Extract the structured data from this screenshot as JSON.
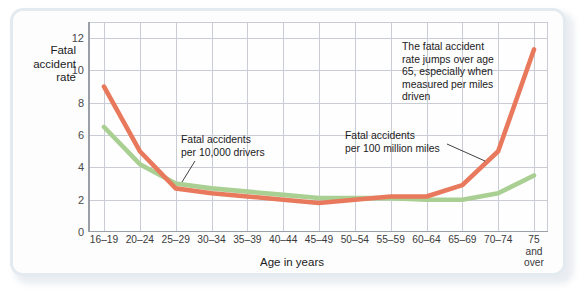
{
  "chart_data": {
    "type": "line",
    "title": "",
    "xlabel": "Age in years",
    "ylabel": "Fatal accident rate",
    "ylim": [
      0,
      13
    ],
    "yticks": [
      0,
      2,
      4,
      6,
      8,
      10,
      12
    ],
    "grid": true,
    "legend_position": "inline-annotations",
    "categories": [
      "16–19",
      "20–24",
      "25–29",
      "30–34",
      "35–39",
      "40–44",
      "45–49",
      "50–54",
      "55–59",
      "60–64",
      "65–69",
      "70–74",
      "75\nand\nover"
    ],
    "series": [
      {
        "name": "Fatal accidents per 100 million miles",
        "color": "#e8795c",
        "values": [
          9.0,
          5.0,
          2.7,
          2.4,
          2.2,
          2.0,
          1.8,
          2.0,
          2.2,
          2.2,
          2.9,
          5.0,
          11.3
        ]
      },
      {
        "name": "Fatal accidents per 10,000 drivers",
        "color": "#a9cf92",
        "values": [
          6.5,
          4.2,
          3.0,
          2.7,
          2.5,
          2.3,
          2.1,
          2.1,
          2.1,
          2.0,
          2.0,
          2.4,
          3.5
        ]
      }
    ],
    "annotations": [
      {
        "id": "annot-drivers",
        "text": "Fatal accidents\nper 10,000 drivers",
        "points_to": "green-line-30-34"
      },
      {
        "id": "annot-miles",
        "text": "Fatal accidents\nper 100 million miles",
        "points_to": "orange-line-70-74"
      },
      {
        "id": "annot-jump",
        "text": "The fatal accident\nrate jumps over age\n65, especially when\nmeasured per miles\ndriven",
        "points_to": "none"
      }
    ]
  },
  "colors": {
    "orange": "#e8795c",
    "green": "#a9cf92",
    "grid": "#c9ccd4",
    "axis": "#9b9fa8",
    "frame": "#e3eaf0",
    "text": "#1b1b1b"
  }
}
